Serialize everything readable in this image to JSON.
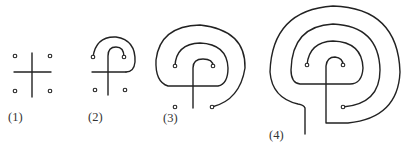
{
  "figure": {
    "ink_color": "#222222",
    "background": "#ffffff",
    "panels": [
      {
        "id": 1,
        "label": "(1)",
        "description": "seed pattern: cross with four dots"
      },
      {
        "id": 2,
        "label": "(2)",
        "description": "first arcs connecting cross arms to dots"
      },
      {
        "id": 3,
        "label": "(3)",
        "description": "additional circuits added"
      },
      {
        "id": 4,
        "label": "(4)",
        "description": "completed labyrinth with entrance"
      }
    ]
  }
}
